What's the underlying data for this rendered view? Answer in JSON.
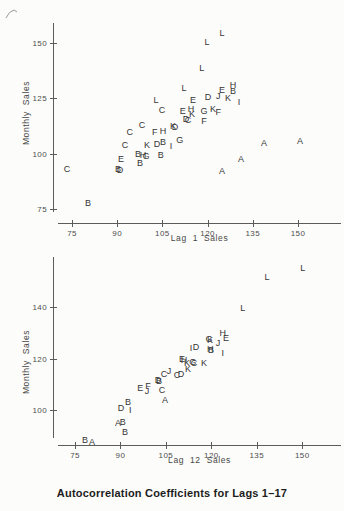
{
  "figure": {
    "caption": "Autocorrelation Coefficients for Lags 1–17",
    "ink_color": "#353535",
    "axis_color": "#5c5c5c",
    "background_color": "#fcfcfa"
  },
  "chart_data": [
    {
      "type": "scatter",
      "title": "",
      "xlabel": "Lag 1 Sales",
      "ylabel": "Monthly Sales",
      "x_ticks": [
        75,
        90,
        105,
        120,
        135,
        150
      ],
      "y_ticks": [
        150,
        125,
        100,
        75
      ],
      "xlim": [
        70,
        164
      ],
      "ylim": [
        74,
        158
      ],
      "grid": false,
      "marker": "month-letter",
      "points": [
        {
          "m": "L",
          "x": 124.8,
          "y": 154.5
        },
        {
          "m": "L",
          "x": 119.8,
          "y": 150.5
        },
        {
          "m": "L",
          "x": 118.1,
          "y": 138.7
        },
        {
          "m": "L",
          "x": 112.2,
          "y": 129.7
        },
        {
          "m": "L",
          "x": 102.9,
          "y": 124.2
        },
        {
          "m": "E",
          "x": 124.8,
          "y": 128.8
        },
        {
          "m": "H",
          "x": 128.4,
          "y": 131.0
        },
        {
          "m": "B",
          "x": 128.4,
          "y": 128.3
        },
        {
          "m": "D",
          "x": 120.1,
          "y": 125.6
        },
        {
          "m": "J",
          "x": 123.5,
          "y": 126.0
        },
        {
          "m": "K",
          "x": 126.8,
          "y": 125.1
        },
        {
          "m": "I",
          "x": 130.4,
          "y": 123.3
        },
        {
          "m": "E",
          "x": 115.2,
          "y": 124.2
        },
        {
          "m": "C",
          "x": 104.9,
          "y": 119.7
        },
        {
          "m": "E",
          "x": 111.8,
          "y": 119.3
        },
        {
          "m": "H",
          "x": 114.5,
          "y": 120.2
        },
        {
          "m": "K",
          "x": 114.8,
          "y": 117.9
        },
        {
          "m": "G",
          "x": 118.8,
          "y": 119.3
        },
        {
          "m": "K",
          "x": 121.8,
          "y": 120.2
        },
        {
          "m": "F",
          "x": 123.5,
          "y": 118.8
        },
        {
          "m": "F",
          "x": 118.8,
          "y": 114.8
        },
        {
          "m": "D",
          "x": 112.8,
          "y": 115.7
        },
        {
          "m": "C",
          "x": 113.5,
          "y": 115.2
        },
        {
          "m": "C",
          "x": 98.2,
          "y": 112.9
        },
        {
          "m": "C",
          "x": 94.2,
          "y": 109.8
        },
        {
          "m": "F",
          "x": 102.5,
          "y": 109.8
        },
        {
          "m": "H",
          "x": 105.2,
          "y": 110.2
        },
        {
          "m": "K",
          "x": 108.5,
          "y": 112.4
        },
        {
          "m": "D",
          "x": 109.2,
          "y": 112.0
        },
        {
          "m": "G",
          "x": 110.8,
          "y": 106.2
        },
        {
          "m": "C",
          "x": 92.6,
          "y": 103.9
        },
        {
          "m": "K",
          "x": 99.9,
          "y": 103.9
        },
        {
          "m": "D",
          "x": 103.2,
          "y": 104.4
        },
        {
          "m": "B",
          "x": 105.2,
          "y": 105.3
        },
        {
          "m": "I",
          "x": 107.9,
          "y": 103.4
        },
        {
          "m": "B",
          "x": 96.9,
          "y": 99.8
        },
        {
          "m": "H",
          "x": 98.6,
          "y": 99.4
        },
        {
          "m": "G",
          "x": 99.6,
          "y": 98.9
        },
        {
          "m": "B",
          "x": 104.5,
          "y": 99.4
        },
        {
          "m": "E",
          "x": 91.3,
          "y": 97.6
        },
        {
          "m": "B",
          "x": 97.6,
          "y": 95.8
        },
        {
          "m": "B",
          "x": 90.3,
          "y": 93.1
        },
        {
          "m": "D",
          "x": 90.9,
          "y": 92.6
        },
        {
          "m": "C",
          "x": 73.3,
          "y": 93.1
        },
        {
          "m": "B",
          "x": 80.3,
          "y": 77.7
        },
        {
          "m": "A",
          "x": 138.7,
          "y": 104.8
        },
        {
          "m": "A",
          "x": 150.7,
          "y": 105.7
        },
        {
          "m": "A",
          "x": 131.1,
          "y": 97.6
        },
        {
          "m": "A",
          "x": 124.8,
          "y": 92.1
        }
      ]
    },
    {
      "type": "scatter",
      "title": "",
      "xlabel": "Lag 12 Sales",
      "ylabel": "Monthly Sales",
      "x_ticks": [
        75,
        90,
        105,
        120,
        135,
        150
      ],
      "y_ticks": [
        140,
        120,
        100
      ],
      "xlim": [
        70,
        164
      ],
      "ylim": [
        89,
        159
      ],
      "grid": false,
      "marker": "month-letter",
      "points": [
        {
          "m": "L",
          "x": 150.2,
          "y": 155.1
        },
        {
          "m": "L",
          "x": 138.4,
          "y": 151.7
        },
        {
          "m": "L",
          "x": 130.4,
          "y": 139.6
        },
        {
          "m": "H",
          "x": 123.8,
          "y": 129.9
        },
        {
          "m": "E",
          "x": 124.8,
          "y": 128.0
        },
        {
          "m": "J",
          "x": 122.2,
          "y": 126.0
        },
        {
          "m": "G",
          "x": 119.2,
          "y": 127.6
        },
        {
          "m": "K",
          "x": 119.6,
          "y": 127.2
        },
        {
          "m": "I",
          "x": 113.3,
          "y": 124.1
        },
        {
          "m": "D",
          "x": 114.9,
          "y": 124.5
        },
        {
          "m": "H",
          "x": 119.6,
          "y": 123.7
        },
        {
          "m": "B",
          "x": 119.9,
          "y": 123.3
        },
        {
          "m": "I",
          "x": 123.8,
          "y": 122.1
        },
        {
          "m": "E",
          "x": 110.3,
          "y": 119.8
        },
        {
          "m": "H",
          "x": 111.0,
          "y": 119.4
        },
        {
          "m": "K",
          "x": 112.0,
          "y": 118.3
        },
        {
          "m": "G",
          "x": 113.9,
          "y": 118.6
        },
        {
          "m": "C",
          "x": 114.3,
          "y": 118.3
        },
        {
          "m": "K",
          "x": 117.6,
          "y": 118.3
        },
        {
          "m": "C",
          "x": 104.4,
          "y": 114.0
        },
        {
          "m": "J",
          "x": 106.0,
          "y": 115.1
        },
        {
          "m": "C",
          "x": 108.7,
          "y": 113.6
        },
        {
          "m": "D",
          "x": 110.0,
          "y": 114.0
        },
        {
          "m": "K",
          "x": 112.3,
          "y": 115.9
        },
        {
          "m": "D",
          "x": 102.4,
          "y": 111.7
        },
        {
          "m": "B",
          "x": 102.7,
          "y": 111.3
        },
        {
          "m": "E",
          "x": 96.5,
          "y": 108.5
        },
        {
          "m": "F",
          "x": 99.1,
          "y": 109.3
        },
        {
          "m": "J",
          "x": 98.8,
          "y": 107.4
        },
        {
          "m": "C",
          "x": 103.7,
          "y": 107.8
        },
        {
          "m": "A",
          "x": 104.7,
          "y": 103.9
        },
        {
          "m": "B",
          "x": 92.5,
          "y": 103.1
        },
        {
          "m": "D",
          "x": 90.2,
          "y": 100.8
        },
        {
          "m": "I",
          "x": 93.2,
          "y": 100.0
        },
        {
          "m": "A",
          "x": 89.2,
          "y": 95.0
        },
        {
          "m": "B",
          "x": 90.8,
          "y": 95.3
        },
        {
          "m": "B",
          "x": 91.5,
          "y": 91.5
        },
        {
          "m": "B",
          "x": 78.3,
          "y": 88.3
        },
        {
          "m": "A",
          "x": 80.6,
          "y": 87.6
        }
      ]
    }
  ]
}
